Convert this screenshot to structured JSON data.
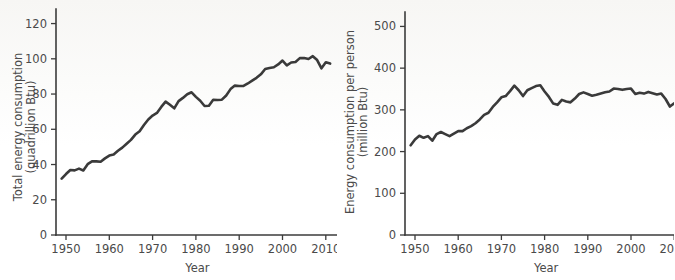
{
  "figure": {
    "background_color": "#ffffff",
    "line_color": "#3a3a3a",
    "axis_color": "#3b3b3b",
    "text_color": "#4a4a4a"
  },
  "chart_data": [
    {
      "type": "line",
      "id": "total-energy-consumption",
      "title": "",
      "xlabel": "Year",
      "ylabel": "Total energy consumption\n(quadrillion Btu)",
      "ylabel_line1": "Total energy consumption",
      "ylabel_line2": "(quadrillion Btu)",
      "xlim": [
        1948,
        2013
      ],
      "ylim": [
        0,
        126
      ],
      "xticks": [
        1950,
        1960,
        1970,
        1980,
        1990,
        2000,
        2010
      ],
      "xticklabels": [
        "1950",
        "1960",
        "1970",
        "1980",
        "1990",
        "2000",
        "2010"
      ],
      "yticks": [
        0,
        20,
        40,
        60,
        80,
        100,
        120
      ],
      "yticklabels": [
        "0",
        "20",
        "40",
        "60",
        "80",
        "100",
        "120"
      ],
      "grid": false,
      "legend": "none",
      "x": [
        1949,
        1950,
        1951,
        1952,
        1953,
        1954,
        1955,
        1956,
        1957,
        1958,
        1959,
        1960,
        1961,
        1962,
        1963,
        1964,
        1965,
        1966,
        1967,
        1968,
        1969,
        1970,
        1971,
        1972,
        1973,
        1974,
        1975,
        1976,
        1977,
        1978,
        1979,
        1980,
        1981,
        1982,
        1983,
        1984,
        1985,
        1986,
        1987,
        1988,
        1989,
        1990,
        1991,
        1992,
        1993,
        1994,
        1995,
        1996,
        1997,
        1998,
        1999,
        2000,
        2001,
        2002,
        2003,
        2004,
        2005,
        2006,
        2007,
        2008,
        2009,
        2010,
        2011
      ],
      "values": [
        32.0,
        34.6,
        36.9,
        36.7,
        37.7,
        36.6,
        40.2,
        41.8,
        41.8,
        41.6,
        43.5,
        45.1,
        45.7,
        47.8,
        49.6,
        51.8,
        54.0,
        57.0,
        58.9,
        62.4,
        65.6,
        67.8,
        69.3,
        72.7,
        75.7,
        73.9,
        71.9,
        76.0,
        77.8,
        79.9,
        81.0,
        78.4,
        76.2,
        73.2,
        73.4,
        76.8,
        76.6,
        76.8,
        79.2,
        82.8,
        84.8,
        84.6,
        84.6,
        86.0,
        87.6,
        89.2,
        91.2,
        94.2,
        94.8,
        95.2,
        96.8,
        99.0,
        96.3,
        97.9,
        98.2,
        100.4,
        100.5,
        99.9,
        101.5,
        99.3,
        94.6,
        98.0,
        97.3
      ]
    },
    {
      "type": "line",
      "id": "energy-consumption-per-person",
      "title": "",
      "xlabel": "Year",
      "ylabel": "Energy consumption per person\n(million Btu)",
      "ylabel_line1": "Energy consumption per person",
      "ylabel_line2": "(million Btu)",
      "xlim": [
        1948,
        2013
      ],
      "ylim": [
        0,
        525
      ],
      "xticks": [
        1950,
        1960,
        1970,
        1980,
        1990,
        2000,
        2010
      ],
      "xticklabels": [
        "1950",
        "1960",
        "1970",
        "1980",
        "1990",
        "2000",
        "2010"
      ],
      "yticks": [
        0,
        100,
        200,
        300,
        400,
        500
      ],
      "yticklabels": [
        "0",
        "100",
        "200",
        "300",
        "400",
        "500"
      ],
      "grid": false,
      "legend": "none",
      "x": [
        1949,
        1950,
        1951,
        1952,
        1953,
        1954,
        1955,
        1956,
        1957,
        1958,
        1959,
        1960,
        1961,
        1962,
        1963,
        1964,
        1965,
        1966,
        1967,
        1968,
        1969,
        1970,
        1971,
        1972,
        1973,
        1974,
        1975,
        1976,
        1977,
        1978,
        1979,
        1980,
        1981,
        1982,
        1983,
        1984,
        1985,
        1986,
        1987,
        1988,
        1989,
        1990,
        1991,
        1992,
        1993,
        1994,
        1995,
        1996,
        1997,
        1998,
        1999,
        2000,
        2001,
        2002,
        2003,
        2004,
        2005,
        2006,
        2007,
        2008,
        2009,
        2010,
        2011
      ],
      "values": [
        215,
        229,
        238,
        233,
        237,
        226,
        242,
        247,
        242,
        237,
        243,
        249,
        249,
        256,
        261,
        268,
        277,
        288,
        293,
        307,
        318,
        330,
        333,
        345,
        358,
        347,
        333,
        347,
        352,
        357,
        359,
        344,
        331,
        315,
        312,
        324,
        320,
        318,
        327,
        338,
        342,
        338,
        334,
        336,
        339,
        342,
        344,
        351,
        350,
        348,
        350,
        351,
        338,
        341,
        339,
        343,
        340,
        337,
        339,
        326,
        308,
        316,
        311
      ]
    }
  ]
}
